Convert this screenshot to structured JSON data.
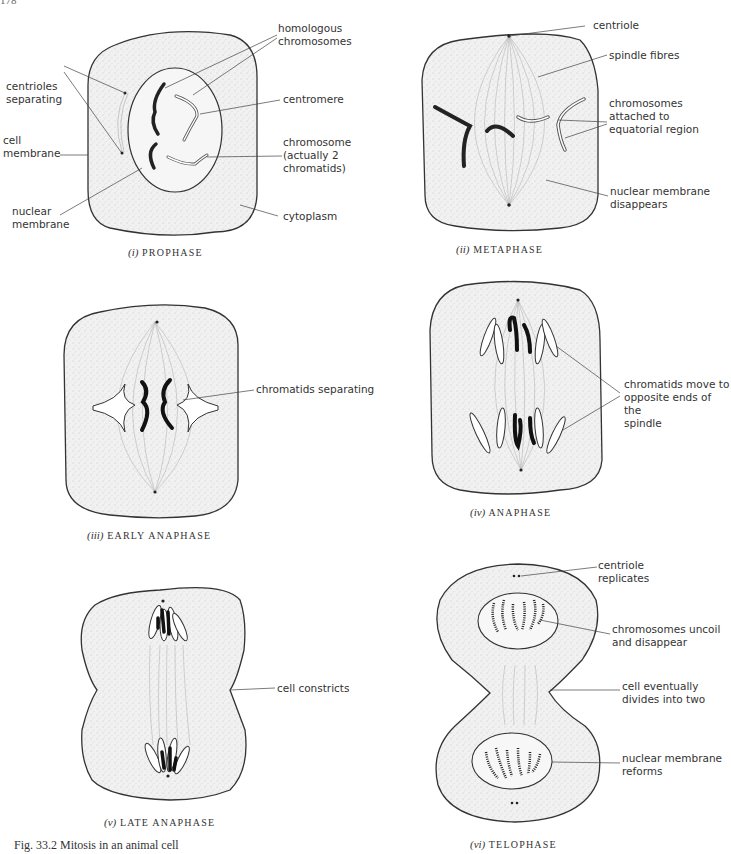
{
  "page_number": "178",
  "figure_caption": "Fig. 33.2   Mitosis in an animal cell",
  "panels": [
    {
      "numeral": "(i)",
      "title": "PROPHASE",
      "labels": [
        "homologous\nchromosomes",
        "centrioles\nseparating",
        "centromere",
        "cell\nmembrane",
        "chromosome\n(actually 2\nchromatids)",
        "nuclear\nmembrane",
        "cytoplasm"
      ]
    },
    {
      "numeral": "(ii)",
      "title": "METAPHASE",
      "labels": [
        "centriole",
        "spindle fibres",
        "chromosomes\nattached to\nequatorial region",
        "nuclear membrane\ndisappears"
      ]
    },
    {
      "numeral": "(iii)",
      "title": "EARLY  ANAPHASE",
      "labels": [
        "chromatids separating"
      ]
    },
    {
      "numeral": "(iv)",
      "title": "ANAPHASE",
      "labels": [
        "chromatids move to\nopposite ends of the\nspindle"
      ]
    },
    {
      "numeral": "(v)",
      "title": "LATE  ANAPHASE",
      "labels": [
        "cell constricts"
      ]
    },
    {
      "numeral": "(vi)",
      "title": "TELOPHASE",
      "labels": [
        "centriole\nreplicates",
        "chromosomes uncoil\nand disappear",
        "cell eventually\ndivides into two",
        "nuclear membrane\nreforms"
      ]
    }
  ]
}
